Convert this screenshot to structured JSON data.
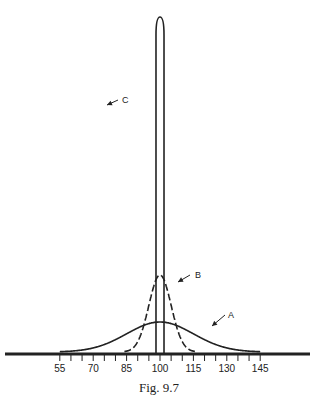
{
  "caption": "Fig. 9.7",
  "chart_data": {
    "type": "line",
    "title": "",
    "xlabel": "",
    "ylabel": "",
    "x_ticks": [
      55,
      70,
      85,
      100,
      115,
      130,
      145
    ],
    "minor_tick_step": 5,
    "xlim": [
      50,
      150
    ],
    "series": [
      {
        "name": "A",
        "style": "solid",
        "mean": 100,
        "sd": 15,
        "relative_peak": 0.09
      },
      {
        "name": "B",
        "style": "dashed",
        "mean": 100,
        "sd": 5,
        "relative_peak": 0.23
      },
      {
        "name": "C",
        "style": "solid",
        "mean": 100,
        "sd": 1.5,
        "relative_peak": 1.0
      }
    ],
    "labels": [
      "A",
      "B",
      "C"
    ]
  }
}
